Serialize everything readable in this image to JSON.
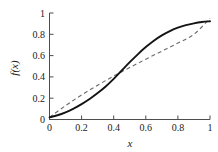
{
  "chart_data": {
    "type": "line",
    "title": "",
    "subtitle": "",
    "xlabel": "x",
    "ylabel": "f(x)",
    "xlim": [
      0,
      1
    ],
    "ylim": [
      0,
      1
    ],
    "xticks": [
      0,
      0.2,
      0.4,
      0.6,
      0.8,
      1
    ],
    "yticks": [
      0,
      0.2,
      0.4,
      0.6,
      0.8,
      1
    ],
    "xticklabels": [
      "0",
      "0.2",
      "0.4",
      "0.6",
      "0.8",
      "1"
    ],
    "yticklabels": [
      "0",
      "0.2",
      "0.4",
      "0.6",
      "0.8",
      "1"
    ],
    "grid": false,
    "legend": "none",
    "spines": [
      "left",
      "bottom"
    ],
    "tick_direction": "in",
    "series": [
      {
        "name": "solid-curve",
        "style": "solid",
        "color": "#141414",
        "linewidth": 1.9,
        "x": [
          0.0,
          0.05,
          0.1,
          0.15,
          0.2,
          0.25,
          0.3,
          0.35,
          0.4,
          0.45,
          0.5,
          0.55,
          0.6,
          0.65,
          0.7,
          0.75,
          0.8,
          0.85,
          0.9,
          0.95,
          1.0
        ],
        "y": [
          0.02,
          0.04,
          0.068,
          0.103,
          0.145,
          0.193,
          0.248,
          0.31,
          0.382,
          0.46,
          0.538,
          0.612,
          0.68,
          0.74,
          0.79,
          0.83,
          0.862,
          0.886,
          0.903,
          0.915,
          0.922
        ]
      },
      {
        "name": "dashed-line",
        "style": "dashed",
        "color": "#6b6b6b",
        "linewidth": 1.1,
        "dasharray": "4 3",
        "x": [
          0.0,
          0.1,
          0.2,
          0.3,
          0.4,
          0.5,
          0.6,
          0.7,
          0.8,
          0.9,
          1.0
        ],
        "y": [
          0.02,
          0.13,
          0.23,
          0.322,
          0.408,
          0.488,
          0.566,
          0.642,
          0.718,
          0.8,
          0.95
        ]
      }
    ],
    "annotations": []
  },
  "axis": {
    "y_title": "f(x)",
    "x_title": "x",
    "x_tick_0": "0",
    "x_tick_1": "0.2",
    "x_tick_2": "0.4",
    "x_tick_3": "0.6",
    "x_tick_4": "0.8",
    "x_tick_5": "1",
    "y_tick_0": "0",
    "y_tick_1": "0.2",
    "y_tick_2": "0.4",
    "y_tick_3": "0.6",
    "y_tick_4": "0.8",
    "y_tick_5": "1"
  },
  "colors": {
    "background": "#ffffff",
    "axis": "#4d4d4d",
    "solid_curve": "#141414",
    "dashed_curve": "#6b6b6b",
    "text": "#1a1a1a"
  }
}
